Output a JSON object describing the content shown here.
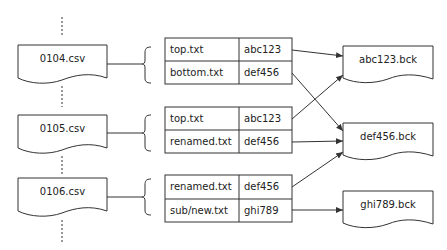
{
  "snapshots": [
    {
      "label": "0104.csv",
      "entries": [
        {
          "path": "top.txt",
          "hash": "abc123"
        },
        {
          "path": "bottom.txt",
          "hash": "def456"
        }
      ]
    },
    {
      "label": "0105.csv",
      "entries": [
        {
          "path": "top.txt",
          "hash": "abc123"
        },
        {
          "path": "renamed.txt",
          "hash": "def456"
        }
      ]
    },
    {
      "label": "0106.csv",
      "entries": [
        {
          "path": "renamed.txt",
          "hash": "def456"
        },
        {
          "path": "sub/new.txt",
          "hash": "ghi789"
        }
      ]
    }
  ],
  "backups": [
    {
      "label": "abc123.bck"
    },
    {
      "label": "def456.bck"
    },
    {
      "label": "ghi789.bck"
    }
  ],
  "colors": {
    "stroke": "#333333",
    "background": "#ffffff"
  }
}
